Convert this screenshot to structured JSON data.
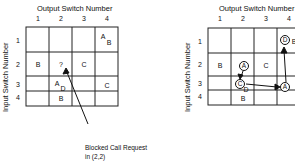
{
  "left": {
    "title": "Output Switch Number",
    "ylabel": "Input Switch Number",
    "col_numbers": [
      "1",
      "2",
      "3",
      "4"
    ],
    "row_numbers": [
      "1",
      "2",
      "3",
      "4"
    ],
    "cells": {
      "r1c4_a": "A",
      "r1c4_b": "B",
      "r2c1": "B",
      "r2c2": "?",
      "r2c3": "C",
      "r3c2_a": "A",
      "r3c2_d": "D",
      "r3c4": "C",
      "r4c2": "B"
    },
    "annotation_line1": "Blocked Call Request",
    "annotation_line2": "in (2,2)"
  },
  "right": {
    "title": "Output Switch Number",
    "ylabel": "Input Switch Number",
    "col_numbers": [
      "1",
      "2",
      "3",
      "4"
    ],
    "row_numbers": [
      "1",
      "2",
      "3",
      "4"
    ],
    "cells": {
      "r1c4_circ": "D",
      "r1c4_b": "B",
      "r2c1": "B",
      "r2c2_circ": "A",
      "r2c3": "C",
      "r3c2_circ": "C",
      "r3c2_d": "D",
      "r3c4_circ": "A",
      "r4c2": "B"
    }
  }
}
